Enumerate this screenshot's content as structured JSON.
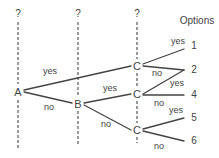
{
  "diagram": {
    "type": "decision-tree",
    "header": {
      "options_label": "Options"
    },
    "columns": [
      {
        "id": "A",
        "question_mark": "?"
      },
      {
        "id": "B",
        "question_mark": "?"
      },
      {
        "id": "C",
        "question_mark": "?"
      }
    ],
    "nodes": [
      {
        "id": "A",
        "label": "A"
      },
      {
        "id": "B",
        "label": "B"
      },
      {
        "id": "C1",
        "label": "C"
      },
      {
        "id": "C2",
        "label": "C"
      },
      {
        "id": "C3",
        "label": "C"
      }
    ],
    "edges": [
      {
        "from": "A",
        "to": "C1",
        "label": "yes"
      },
      {
        "from": "A",
        "to": "B",
        "label": "no"
      },
      {
        "from": "B",
        "to": "C2",
        "label": "yes"
      },
      {
        "from": "B",
        "to": "C3",
        "label": "no"
      },
      {
        "from": "C1",
        "to": "1",
        "label": "yes"
      },
      {
        "from": "C1",
        "to": "2",
        "label": "no"
      },
      {
        "from": "C2",
        "to": "2",
        "label": "yes"
      },
      {
        "from": "C2",
        "to": "4",
        "label": "no"
      },
      {
        "from": "C3",
        "to": "5",
        "label": "yes"
      },
      {
        "from": "C3",
        "to": "6",
        "label": "no"
      }
    ],
    "options": [
      "1",
      "2",
      "4",
      "5",
      "6"
    ],
    "colors": {
      "line": "#444444",
      "dash": "#555555",
      "text": "#444444"
    }
  }
}
